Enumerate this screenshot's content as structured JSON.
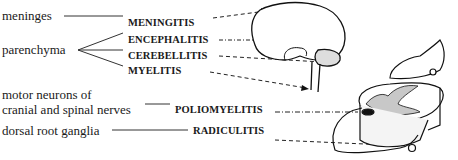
{
  "structures": [
    {
      "id": "meninges",
      "label": "meninges"
    },
    {
      "id": "parenchyma",
      "label": "parenchyma"
    },
    {
      "id": "motor_neurons",
      "label_line1": "motor neurons of",
      "label_line2": "cranial and spinal nerves"
    },
    {
      "id": "drg",
      "label": "dorsal root ganglia"
    }
  ],
  "diseases": [
    {
      "label": "MENINGITIS"
    },
    {
      "label": "ENCEPHALITIS"
    },
    {
      "label": "CEREBELLITIS"
    },
    {
      "label": "MYELITIS"
    },
    {
      "label": "POLIOMYELITIS"
    },
    {
      "label": "RADICULITIS"
    }
  ],
  "illustrations": [
    {
      "name": "brain-with-cerebellum-and-brainstem"
    },
    {
      "name": "spinal-cord-cross-section-with-dorsal-root-ganglion"
    }
  ]
}
